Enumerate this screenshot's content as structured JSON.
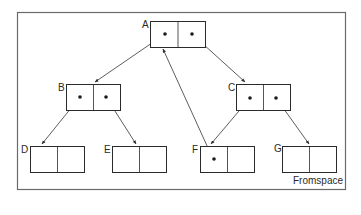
{
  "diagram": {
    "region_label": "Fromspace",
    "colors": {
      "line": "#2a2a2a",
      "frame": "#6a6a6a",
      "background": "#ffffff"
    },
    "nodes": [
      {
        "id": "A",
        "label": "A",
        "fields": [
          "pointer",
          "pointer"
        ]
      },
      {
        "id": "B",
        "label": "B",
        "fields": [
          "pointer",
          "pointer"
        ]
      },
      {
        "id": "C",
        "label": "C",
        "fields": [
          "pointer",
          "pointer"
        ]
      },
      {
        "id": "D",
        "label": "D",
        "fields": [
          "empty",
          "empty"
        ]
      },
      {
        "id": "E",
        "label": "E",
        "fields": [
          "empty",
          "empty"
        ]
      },
      {
        "id": "F",
        "label": "F",
        "fields": [
          "pointer",
          "empty"
        ]
      },
      {
        "id": "G",
        "label": "G",
        "fields": [
          "empty",
          "empty"
        ]
      }
    ],
    "edges": [
      {
        "from": "A.0",
        "to": "B"
      },
      {
        "from": "A.1",
        "to": "C"
      },
      {
        "from": "B.0",
        "to": "D"
      },
      {
        "from": "B.1",
        "to": "E"
      },
      {
        "from": "C.0",
        "to": "F"
      },
      {
        "from": "C.1",
        "to": "G"
      },
      {
        "from": "F.0",
        "to": "A"
      }
    ]
  }
}
